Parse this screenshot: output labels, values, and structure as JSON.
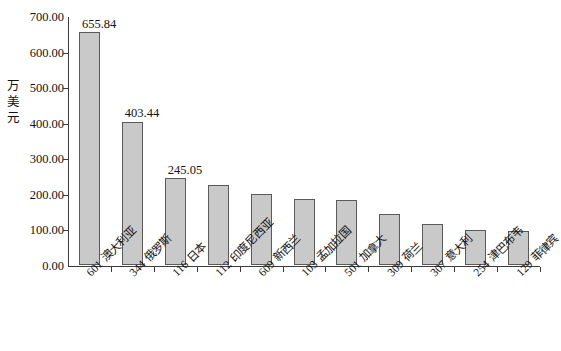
{
  "chart_data": {
    "type": "bar",
    "title": "",
    "subtitle": "",
    "xlabel": "",
    "ylabel": "万美元",
    "ylim": [
      0,
      700
    ],
    "ytick_values": [
      700.0,
      600.0,
      500.0,
      400.0,
      300.0,
      200.0,
      100.0,
      0.0
    ],
    "ytick_labels": [
      "700.00",
      "600.00",
      "500.00",
      "400.00",
      "300.00",
      "200.00",
      "100.00",
      "0.00"
    ],
    "grid": false,
    "legend": "none",
    "bar_fill_color": "#c9c9c9",
    "bar_border_color": "#5a5a5a",
    "axis_color": "#3c3c3c",
    "categories": [
      "601 澳大利亚",
      "344 俄罗斯",
      "116 日本",
      "112 印度尼西亚",
      "609 新西兰",
      "103 孟加拉国",
      "501 加拿大",
      "309 荷兰",
      "307 意大利",
      "254 津巴布韦",
      "129 菲律宾"
    ],
    "category_codes": [
      "601",
      "344",
      "116",
      "112",
      "609",
      "103",
      "501",
      "309",
      "307",
      "254",
      "129"
    ],
    "category_names": [
      "澳大利亚",
      "俄罗斯",
      "日本",
      "印度尼西亚",
      "新西兰",
      "孟加拉国",
      "加拿大",
      "荷兰",
      "意大利",
      "津巴布韦",
      "菲律宾"
    ],
    "values": [
      655.84,
      403.44,
      245.05,
      224.0,
      199.0,
      185.0,
      183.0,
      144.0,
      116.0,
      98.0,
      95.0
    ],
    "data_labels": [
      "655.84",
      "403.44",
      "245.05",
      "",
      "",
      "",
      "",
      "",
      "",
      "",
      ""
    ],
    "labeled_points": [
      {
        "category": "601 澳大利亚",
        "value": 655.84,
        "label": "655.84"
      },
      {
        "category": "344 俄罗斯",
        "value": 403.44,
        "label": "403.44"
      },
      {
        "category": "116 日本",
        "value": 245.05,
        "label": "245.05"
      }
    ]
  }
}
